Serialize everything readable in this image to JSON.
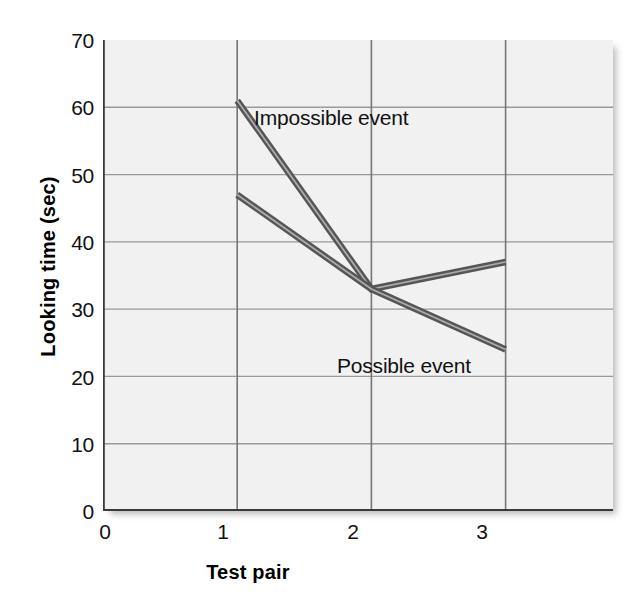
{
  "chart_data": {
    "type": "line",
    "title": "",
    "subtitle": "",
    "xlabel": "Test pair",
    "ylabel": "Looking time (sec)",
    "x": [
      1,
      2,
      3
    ],
    "xlim": [
      0,
      3.8
    ],
    "ylim": [
      0,
      70
    ],
    "xticks": [
      "0",
      "1",
      "2",
      "3"
    ],
    "xtick_values": [
      0,
      1,
      2,
      3
    ],
    "yticks": [
      "0",
      "10",
      "20",
      "30",
      "40",
      "50",
      "60",
      "70"
    ],
    "ytick_values": [
      0,
      10,
      20,
      30,
      40,
      50,
      60,
      70
    ],
    "grid": true,
    "grid_color": "#9a9a9a",
    "plot_background": "#f1f1f1",
    "legend": "inline-annotations",
    "series": [
      {
        "name": "Impossible event",
        "values": [
          61,
          33,
          37
        ],
        "color": "#5a5a5a",
        "label_x": 1.3,
        "label_y": 57
      },
      {
        "name": "Possible event",
        "values": [
          47,
          33,
          24
        ],
        "color": "#5a5a5a",
        "label_x": 1.9,
        "label_y": 24
      }
    ],
    "annotations": [
      {
        "text": "Impossible event"
      },
      {
        "text": "Possible event"
      }
    ]
  },
  "axes": {
    "y_title": "Looking time (sec)",
    "x_title": "Test pair",
    "y_tick_labels": [
      "70",
      "60",
      "50",
      "40",
      "30",
      "20",
      "10",
      "0"
    ],
    "x_tick_labels": [
      "0",
      "1",
      "2",
      "3"
    ]
  },
  "labels": {
    "impossible": "Impossible event",
    "possible": "Possible event"
  },
  "colors": {
    "line": "#5a5a5a",
    "line_highlight": "#a8a8a8",
    "grid": "#9a9a9a",
    "axis": "#3a3a3a",
    "panel": "#f1f1f1",
    "text": "#111111"
  }
}
